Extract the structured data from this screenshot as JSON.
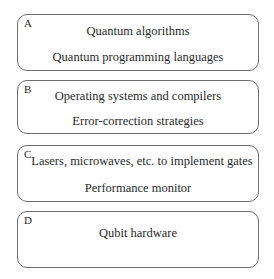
{
  "diagram": {
    "type": "layered-stack",
    "layers": [
      {
        "letter": "A",
        "lines": [
          "Quantum algorithms",
          "Quantum programming languages"
        ]
      },
      {
        "letter": "B",
        "lines": [
          "Operating systems and compilers",
          "Error-correction strategies"
        ]
      },
      {
        "letter": "C",
        "lines": [
          "Lasers, microwaves, etc. to implement gates",
          "Performance monitor"
        ]
      },
      {
        "letter": "D",
        "lines": [
          "Qubit hardware"
        ]
      }
    ]
  },
  "colors": {
    "border": "#6e6e6e",
    "text": "#2a2a2a",
    "background": "#ffffff"
  }
}
